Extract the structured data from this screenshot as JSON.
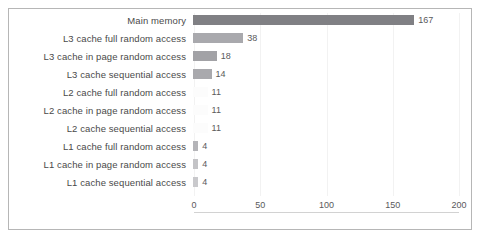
{
  "chart_data": {
    "type": "bar",
    "orientation": "horizontal",
    "title": "",
    "xlabel": "",
    "ylabel": "",
    "xlim": [
      0,
      200
    ],
    "xticks": [
      0,
      50,
      100,
      150,
      200
    ],
    "grid": true,
    "legend": false,
    "value_labels": true,
    "categories": [
      "Main memory",
      "L3  cache full random access",
      "L3  cache in page random access",
      "L3  cache sequential access",
      "L2  cache full random access",
      "L2  cache in page random access",
      "L2  cache sequential access",
      "L1  cache full random access",
      "L1  cache in page random access",
      "L1  cache sequential access"
    ],
    "values": [
      167,
      38,
      18,
      14,
      11,
      11,
      11,
      4,
      4,
      4
    ],
    "value_label_texts": [
      "167",
      "38",
      "18",
      "14",
      "11",
      "11",
      "11",
      "4",
      "4",
      "4"
    ],
    "bar_colors": [
      "#808084",
      "#a9a9ad",
      "#a2a2a6",
      "#a9a9ad",
      "#fcfcfc",
      "#fcfcfc",
      "#fcfcfc",
      "#b4b4b8",
      "#c3c3c6",
      "#c9c9cc"
    ],
    "xtick_labels": [
      "0",
      "50",
      "100",
      "150",
      "200"
    ]
  },
  "style": {
    "frame_border_color": "#b6b6b6",
    "gridline_color": "#f2f2f2",
    "axis_line_color": "#d2d2d2",
    "label_text_color": "#4a4a4a",
    "value_text_color": "#59595b",
    "background": "#ffffff"
  }
}
